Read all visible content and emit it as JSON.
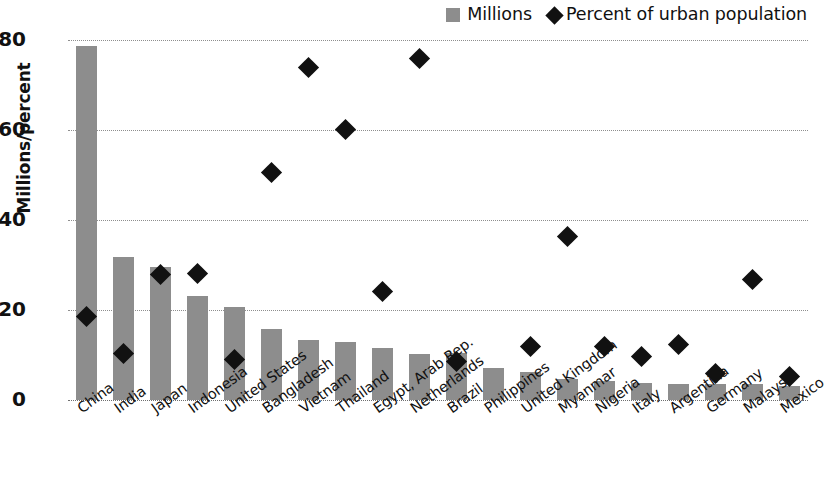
{
  "chart_data": {
    "type": "bar",
    "title": "",
    "xlabel": "",
    "ylabel": "Millions/percent",
    "ylim": [
      0,
      80
    ],
    "yticks": [
      0,
      20,
      40,
      60,
      80
    ],
    "grid": true,
    "legend_position": "top-right",
    "categories": [
      "China",
      "India",
      "Japan",
      "Indonesia",
      "United States",
      "Bangladesh",
      "Vietnam",
      "Thailand",
      "Egypt, Arab Rep.",
      "Netherlands",
      "Brazil",
      "Philippines",
      "United Kingdom",
      "Myanmar",
      "Nigeria",
      "Italy",
      "Argentina",
      "Germany",
      "Malaysia",
      "Mexico"
    ],
    "series": [
      {
        "name": "Millions",
        "type": "bar",
        "color": "#8d8d8d",
        "values": [
          78.6,
          31.8,
          29.5,
          23.1,
          20.6,
          15.8,
          13.3,
          13.0,
          11.6,
          10.3,
          10.5,
          7.1,
          6.2,
          4.6,
          4.3,
          3.8,
          3.6,
          3.5,
          3.5,
          3.1
        ]
      },
      {
        "name": "Percent of urban population",
        "type": "scatter",
        "marker": "diamond",
        "color": "#111111",
        "values": [
          18.6,
          10.4,
          27.8,
          28.2,
          9.0,
          50.5,
          74.0,
          60.2,
          24.2,
          75.8,
          8.5,
          null,
          11.9,
          36.3,
          11.8,
          9.6,
          12.4,
          5.8,
          26.7,
          5.2
        ]
      }
    ]
  },
  "legend": {
    "entries": [
      {
        "label": "Millions",
        "marker": "square"
      },
      {
        "label": "Percent of urban population",
        "marker": "diamond"
      }
    ]
  },
  "axes": {
    "y_title": "Millions/percent",
    "y_tick_labels": [
      "80",
      "60",
      "40",
      "20",
      "0"
    ]
  }
}
